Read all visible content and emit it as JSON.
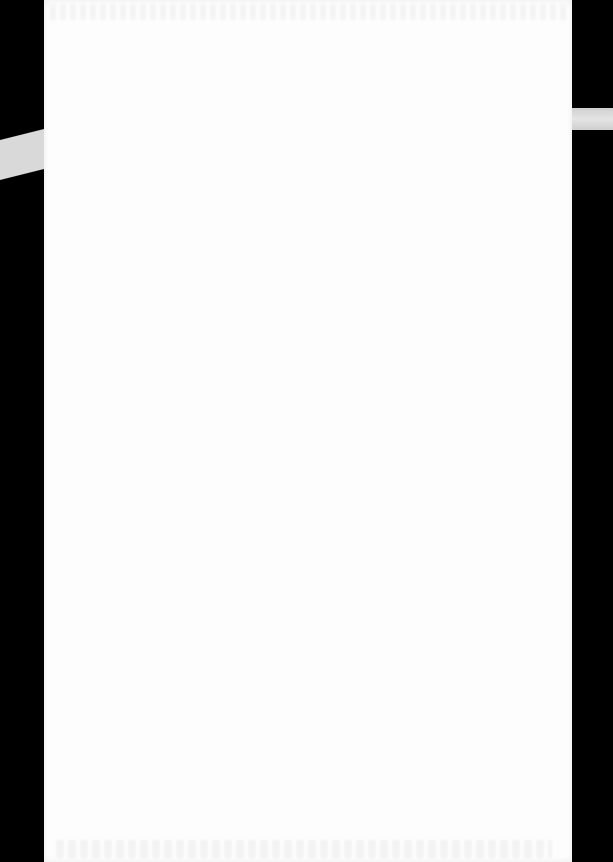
{
  "document": {
    "type": "scanned-page",
    "content": "",
    "note": "Blank page with faint illegible show-through text at top and bottom edges",
    "colors": {
      "page": "#fdfdfd",
      "scanner_background": "#000000",
      "edge_strips": "#d9d9d9"
    }
  }
}
